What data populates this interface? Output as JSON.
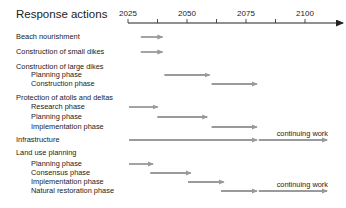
{
  "chart_data": {
    "type": "gantt",
    "title": "Response actions",
    "xlabel": "",
    "ylabel": "",
    "x_ticks": [
      2025,
      2050,
      2075,
      2100
    ],
    "x_range": [
      2025,
      2110
    ],
    "grid": false,
    "bar_color": "#9a9a9a",
    "rows": [
      {
        "label": "Beach nourishment",
        "level": 0,
        "y": 37,
        "bars": [
          {
            "start": 2030,
            "end": 2040
          }
        ]
      },
      {
        "label": "Construction of small dikes",
        "level": 0,
        "y": 52,
        "bars": [
          {
            "start": 2030,
            "end": 2040
          }
        ]
      },
      {
        "label": "Construction of large dikes",
        "level": 0,
        "y": 67,
        "bars": []
      },
      {
        "label": "Planning phase",
        "level": 1,
        "y": 75,
        "bars": [
          {
            "start": 2040,
            "end": 2060
          }
        ]
      },
      {
        "label": "Construction phase",
        "level": 1,
        "y": 84,
        "bars": [
          {
            "start": 2060,
            "end": 2080
          }
        ]
      },
      {
        "label": "Protection of atolls and deltas",
        "level": 0,
        "y": 98,
        "bars": []
      },
      {
        "label": "Research phase",
        "level": 1,
        "y": 107,
        "bars": [
          {
            "start": 2025,
            "end": 2038
          }
        ]
      },
      {
        "label": "Planning phase",
        "level": 1,
        "y": 117,
        "bars": [
          {
            "start": 2037,
            "end": 2059
          }
        ]
      },
      {
        "label": "Implementation phase",
        "level": 1,
        "y": 127,
        "bars": [
          {
            "start": 2060,
            "end": 2080
          }
        ]
      },
      {
        "label": "Infrastructure",
        "level": 0,
        "y": 140,
        "bars": [
          {
            "start": 2025,
            "end": 2080
          },
          {
            "start": 2080,
            "end": 2110,
            "annotation": "continuing work"
          }
        ]
      },
      {
        "label": "Land use planning",
        "level": 0,
        "y": 153,
        "bars": []
      },
      {
        "label": "Planning phase",
        "level": 1,
        "y": 164,
        "bars": [
          {
            "start": 2025,
            "end": 2036
          }
        ]
      },
      {
        "label": "Consensus phase",
        "level": 1,
        "y": 173,
        "bars": [
          {
            "start": 2034,
            "end": 2052
          }
        ]
      },
      {
        "label": "Implementation phase",
        "level": 1,
        "y": 182,
        "bars": [
          {
            "start": 2050,
            "end": 2066
          }
        ]
      },
      {
        "label": "Natural restoration phase",
        "level": 1,
        "y": 191,
        "bars": [
          {
            "start": 2064,
            "end": 2080
          },
          {
            "start": 2080,
            "end": 2110,
            "annotation": "continuing work"
          }
        ]
      }
    ],
    "annotations": [
      "continuing work",
      "continuing work"
    ]
  }
}
